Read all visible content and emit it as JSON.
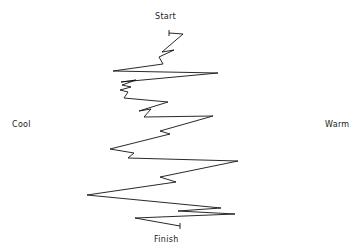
{
  "chart_data": {
    "type": "line",
    "title": "",
    "xlabel": "",
    "ylabel": "",
    "labels": {
      "top": "Start",
      "bottom": "Finish",
      "left": "Cool",
      "right": "Warm"
    },
    "orientation": "vertical trace from Start (top) to Finish (bottom); horizontal position = Cool (left) to Warm (right)",
    "grid": false,
    "legend": null,
    "series": [
      {
        "name": "trace",
        "color": "#111111",
        "points_px": [
          [
            169,
            33
          ],
          [
            183,
            34
          ],
          [
            162,
            52
          ],
          [
            174,
            50
          ],
          [
            159,
            57
          ],
          [
            163,
            64
          ],
          [
            113,
            71
          ],
          [
            218,
            73
          ],
          [
            121,
            82
          ],
          [
            136,
            80
          ],
          [
            122,
            85
          ],
          [
            131,
            87
          ],
          [
            120,
            90
          ],
          [
            128,
            92
          ],
          [
            124,
            98
          ],
          [
            168,
            102
          ],
          [
            139,
            111
          ],
          [
            151,
            109
          ],
          [
            144,
            117
          ],
          [
            213,
            116
          ],
          [
            160,
            131
          ],
          [
            170,
            134
          ],
          [
            110,
            149
          ],
          [
            134,
            153
          ],
          [
            128,
            158
          ],
          [
            238,
            161
          ],
          [
            160,
            177
          ],
          [
            176,
            182
          ],
          [
            87,
            195
          ],
          [
            221,
            208
          ],
          [
            178,
            211
          ],
          [
            235,
            214
          ],
          [
            135,
            218
          ],
          [
            180,
            226
          ]
        ]
      }
    ],
    "start_marker_px": [
      169,
      33
    ],
    "end_marker_px": [
      180,
      226
    ]
  }
}
